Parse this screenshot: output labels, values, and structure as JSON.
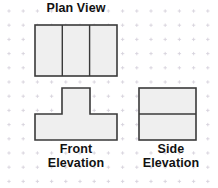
{
  "sheet": {
    "width": 218,
    "height": 188,
    "background_color": "#ffffff"
  },
  "grid": {
    "name": "dotted-grid-paper",
    "mark_style": "small-cross",
    "spacing_px": 14.2,
    "origin_x": 9,
    "origin_y": 11,
    "color": "#d7d2dc",
    "mark_size_px": 3.4
  },
  "style": {
    "shape_fill": "#efefef",
    "shape_stroke": "#3a3a3a",
    "shape_stroke_width": 1.6,
    "divider_stroke": "#3a3a3a",
    "divider_stroke_width": 1.4,
    "label_color": "#121212"
  },
  "views": {
    "plan": {
      "title": "Plan View",
      "shape_name": "plan-view-rectangle",
      "outline": {
        "x": 35,
        "y": 25,
        "width": 82,
        "height": 51
      },
      "divider_orientation": "vertical",
      "divider_x_positions": [
        62.3,
        89.6
      ],
      "panel_count": 3
    },
    "front": {
      "title": "Front\nElevation",
      "shape_name": "front-elevation-tee",
      "polygon_points": "35,114 62,114 62,88 90,88 90,114 117,114 117,140 35,140",
      "bounds": {
        "x": 35,
        "y": 88,
        "width": 82,
        "height": 52
      },
      "stem": {
        "x": 62,
        "y": 88,
        "width": 28,
        "height": 26
      },
      "base": {
        "x": 35,
        "y": 114,
        "width": 82,
        "height": 26
      }
    },
    "side": {
      "title": "Side\nElevation",
      "shape_name": "side-elevation-rectangle",
      "outline": {
        "x": 139,
        "y": 88,
        "width": 57,
        "height": 52
      },
      "divider_orientation": "horizontal",
      "divider_y_positions": [
        114
      ],
      "panel_count": 2
    }
  }
}
